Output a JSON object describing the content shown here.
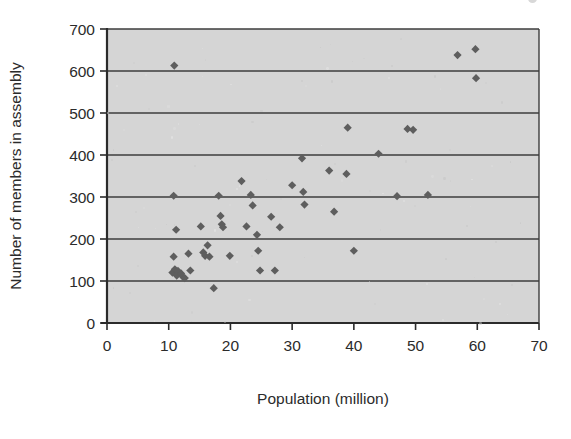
{
  "figure": {
    "background_color": "#ffffff",
    "plot_background_color": "#d5d5d5",
    "marker_color": "#5e5e5e",
    "axis_color": "#2b2b2b",
    "gridline_color": "#3d3d3d"
  },
  "chart_data": {
    "type": "scatter",
    "title": "",
    "xlabel": "Population (million)",
    "ylabel": "Number of members in assembly",
    "xlim": [
      0,
      70
    ],
    "ylim": [
      0,
      700
    ],
    "xticks": [
      0,
      10,
      20,
      30,
      40,
      50,
      60,
      70
    ],
    "yticks": [
      0,
      100,
      200,
      300,
      400,
      500,
      600,
      700
    ],
    "xtick_labels": [
      "0",
      "10",
      "20",
      "30",
      "40",
      "50",
      "60",
      "70"
    ],
    "ytick_labels": [
      "0",
      "100",
      "200",
      "300",
      "400",
      "500",
      "600",
      "700"
    ],
    "grid": "horizontal",
    "legend": "none",
    "marker": "diamond",
    "series": [
      {
        "name": "Countries",
        "points": [
          [
            10.9,
            613
          ],
          [
            10.8,
            303
          ],
          [
            11.2,
            222
          ],
          [
            10.8,
            158
          ],
          [
            10.6,
            120
          ],
          [
            11.0,
            128
          ],
          [
            11.3,
            113
          ],
          [
            11.5,
            124
          ],
          [
            12.0,
            118
          ],
          [
            12.3,
            110
          ],
          [
            12.6,
            107
          ],
          [
            13.2,
            165
          ],
          [
            13.5,
            125
          ],
          [
            15.2,
            230
          ],
          [
            15.6,
            168
          ],
          [
            15.9,
            160
          ],
          [
            16.3,
            185
          ],
          [
            16.6,
            158
          ],
          [
            17.3,
            83
          ],
          [
            18.1,
            303
          ],
          [
            18.4,
            255
          ],
          [
            18.6,
            235
          ],
          [
            18.8,
            228
          ],
          [
            19.9,
            160
          ],
          [
            21.8,
            338
          ],
          [
            22.6,
            230
          ],
          [
            23.3,
            305
          ],
          [
            23.6,
            280
          ],
          [
            24.3,
            210
          ],
          [
            24.5,
            172
          ],
          [
            24.8,
            125
          ],
          [
            26.6,
            253
          ],
          [
            27.2,
            125
          ],
          [
            28.0,
            228
          ],
          [
            30.0,
            328
          ],
          [
            31.6,
            392
          ],
          [
            31.8,
            312
          ],
          [
            32.0,
            282
          ],
          [
            36.0,
            363
          ],
          [
            36.8,
            265
          ],
          [
            38.8,
            355
          ],
          [
            39.0,
            465
          ],
          [
            40.0,
            172
          ],
          [
            44.0,
            403
          ],
          [
            47.0,
            302
          ],
          [
            48.7,
            462
          ],
          [
            49.6,
            460
          ],
          [
            52.0,
            305
          ],
          [
            56.8,
            638
          ],
          [
            59.7,
            652
          ],
          [
            59.8,
            583
          ]
        ]
      }
    ]
  },
  "geometry": {
    "plot_left_px": 107,
    "plot_right_px": 539,
    "plot_top_px": 29,
    "plot_bottom_px": 323
  }
}
